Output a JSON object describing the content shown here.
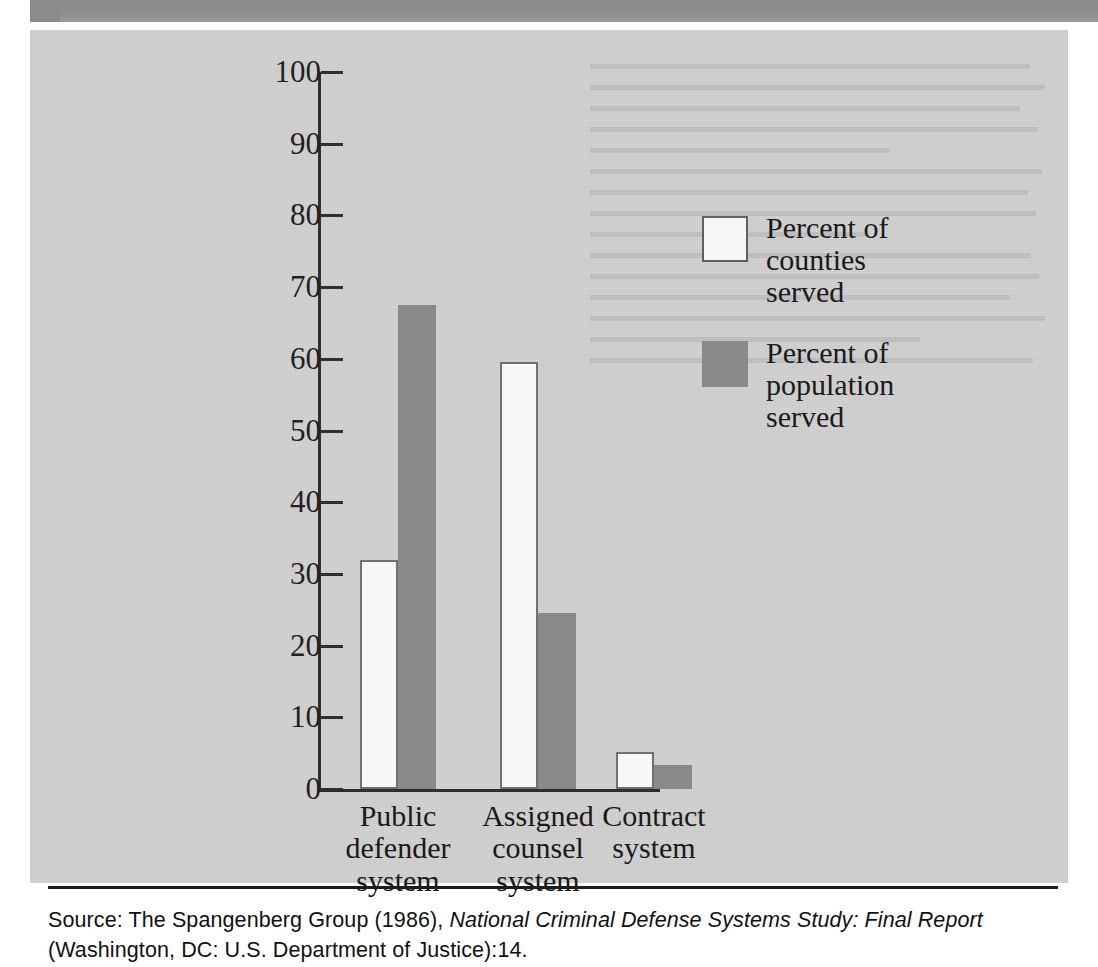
{
  "figure": {
    "panel_bg": "#d2d2d2",
    "top_band_color": "#8b8b8b"
  },
  "legend": {
    "items": [
      {
        "swatch": "white",
        "color": "#ffffff",
        "label": "Percent of\ncounties\nserved",
        "line1": "Percent of",
        "line2": "counties",
        "line3": "served"
      },
      {
        "swatch": "grey",
        "color": "#8a8a8a",
        "label": "Percent of\npopulation\nserved",
        "line1": "Percent of",
        "line2": "population",
        "line3": "served"
      }
    ]
  },
  "axis": {
    "ticks": [
      "100",
      "90",
      "80",
      "70",
      "60",
      "50",
      "40",
      "30",
      "20",
      "10",
      "0"
    ]
  },
  "categories": [
    {
      "line1": "Public",
      "line2": "defender",
      "line3": "system"
    },
    {
      "line1": "Assigned",
      "line2": "counsel",
      "line3": "system"
    },
    {
      "line1": "Contract",
      "line2": "system",
      "line3": ""
    }
  ],
  "source": {
    "prefix": "Source: The Spangenberg Group (1986), ",
    "title": "National Criminal Defense Systems Study: Final Report",
    "suffix": " (Washington, DC: U.S. Department of Justice):14."
  },
  "chart_data": {
    "type": "bar",
    "title": "",
    "xlabel": "",
    "ylabel": "",
    "ylim": [
      0,
      100
    ],
    "yticks": [
      0,
      10,
      20,
      30,
      40,
      50,
      60,
      70,
      80,
      90,
      100
    ],
    "grid": false,
    "legend_position": "upper-right",
    "categories": [
      "Public defender system",
      "Assigned counsel system",
      "Contract system"
    ],
    "series": [
      {
        "name": "Percent of counties served",
        "color": "#ffffff",
        "values": [
          32,
          59.5,
          5.2
        ]
      },
      {
        "name": "Percent of population served",
        "color": "#8a8a8a",
        "values": [
          67.5,
          24.5,
          3.3
        ]
      }
    ]
  }
}
